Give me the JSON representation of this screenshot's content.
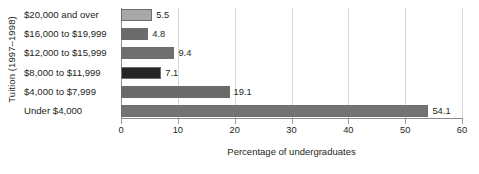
{
  "chart_data": {
    "type": "bar",
    "orientation": "horizontal",
    "title": "",
    "xlabel": "Percentage of undergraduates",
    "ylabel": "Tuition (1997–1998)",
    "xlim": [
      0,
      60
    ],
    "xticks": [
      0,
      10,
      20,
      30,
      40,
      50,
      60
    ],
    "xtick_labels": [
      "0",
      "10",
      "20",
      "30",
      "40",
      "50",
      "60"
    ],
    "grid": "vertical",
    "legend": "none",
    "categories": [
      "$20,000 and over",
      "$16,000 to $19,999",
      "$12,000 to $15,999",
      "$8,000 to $11,999",
      "$4,000 to $7,999",
      "Under $4,000"
    ],
    "values": [
      5.5,
      4.8,
      9.4,
      7.1,
      19.1,
      54.1
    ],
    "value_labels": [
      "5.5",
      "4.8",
      "9.4",
      "7.1",
      "19.1",
      "54.1"
    ],
    "bar_colors": [
      "#a8a8a8",
      "#6b6b6b",
      "#6f6f6f",
      "#262626",
      "#6a6a6a",
      "#737373"
    ],
    "bar_border_color": "#6e6e6e",
    "gridline_color": "#d9d9d9",
    "axis_color": "#8c8c8c",
    "text_color": "#231f20",
    "background": "#ffffff"
  }
}
